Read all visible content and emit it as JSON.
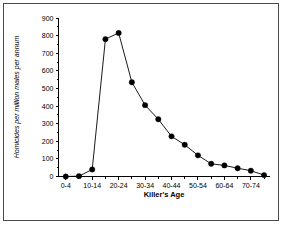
{
  "chart_data": {
    "type": "line",
    "title": "",
    "subtitle": "",
    "xlabel": "Killer's Age",
    "ylabel": "Homicides per million males per annum",
    "categories": [
      "0-4",
      "5-9",
      "10-14",
      "15-19",
      "20-24",
      "25-29",
      "30-34",
      "35-39",
      "40-44",
      "45-49",
      "50-54",
      "55-59",
      "60-64",
      "65-69",
      "70-74",
      "75-79"
    ],
    "x_tick_labels": [
      "0-4",
      "10-14",
      "20-24",
      "30-34",
      "40-44",
      "50-54",
      "60-64",
      "70-74"
    ],
    "x_tick_label_indices": [
      0,
      2,
      4,
      6,
      8,
      10,
      12,
      14
    ],
    "values": [
      0,
      2,
      40,
      780,
      815,
      535,
      405,
      325,
      228,
      180,
      120,
      72,
      63,
      47,
      33,
      8
    ],
    "y_tick_labels": [
      "0",
      "100",
      "200",
      "300",
      "400",
      "500",
      "600",
      "700",
      "800",
      "900"
    ],
    "y_ticks": [
      0,
      100,
      200,
      300,
      400,
      500,
      600,
      700,
      800,
      900
    ],
    "ylim": [
      0,
      900
    ],
    "xlim": [
      0,
      15
    ],
    "grid": false,
    "legend": false,
    "marker": "filled-circle",
    "series_color": "#000000",
    "minor_x_ticks": true
  },
  "figure": {
    "border_color": "#4a4a4a",
    "background": "#ffffff"
  }
}
